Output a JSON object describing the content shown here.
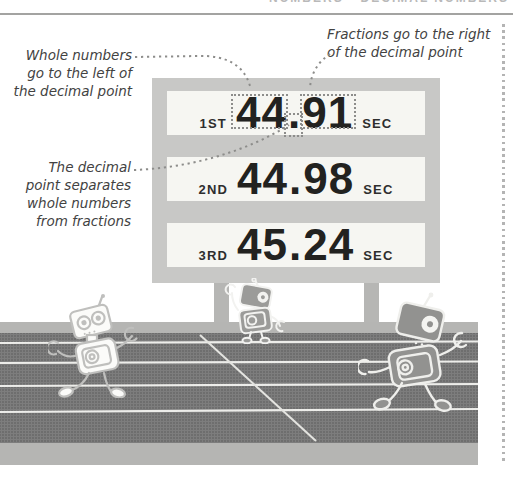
{
  "page": {
    "header_label": "NUMBERS • DECIMAL NUMBERS"
  },
  "annotations": {
    "whole_numbers": {
      "lines": [
        "Whole numbers",
        "go to the left of",
        "the decimal point"
      ]
    },
    "fractions": {
      "lines": [
        "Fractions go to the right",
        "of the decimal point"
      ]
    },
    "decimal_separator": {
      "lines": [
        "The decimal",
        "point separates",
        "whole numbers",
        "from fractions"
      ]
    }
  },
  "scoreboard": {
    "rows": [
      {
        "position": "1ST",
        "whole": "44",
        "point": ".",
        "fraction": "91",
        "unit": "SEC"
      },
      {
        "position": "2ND",
        "whole": "44",
        "point": ".",
        "fraction": "98",
        "unit": "SEC"
      },
      {
        "position": "3RD",
        "whole": "45",
        "point": ".",
        "fraction": "24",
        "unit": "SEC"
      }
    ]
  },
  "colors": {
    "board_frame": "#c8c8c6",
    "board_row_bg": "#f6f6f2",
    "score_text": "#222220",
    "track_dark": "#6e6e6e",
    "track_light": "#b5b5b3",
    "lane_line": "#ededea",
    "annotation_text": "#424242",
    "dotted_line": "#8d8d8b",
    "robot_light": "#bfbfbd",
    "robot_dark": "#929290"
  }
}
